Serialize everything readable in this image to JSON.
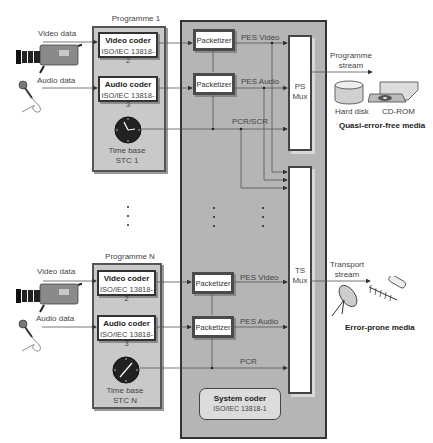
{
  "programmes": [
    {
      "title": "Programme 1",
      "video_input_label": "Video data",
      "audio_input_label": "Audio data",
      "video_coder": {
        "title": "Video coder",
        "standard": "ISO/IEC 13818-2"
      },
      "audio_coder": {
        "title": "Audio coder",
        "standard": "ISO/IEC 13818-3"
      },
      "time_base": {
        "line1": "Time base",
        "line2": "STC 1"
      }
    },
    {
      "title": "Programme N",
      "video_input_label": "Video data",
      "audio_input_label": "Audio data",
      "video_coder": {
        "title": "Video coder",
        "standard": "ISO/IEC 13818-2"
      },
      "audio_coder": {
        "title": "Audio coder",
        "standard": "ISO/IEC 13818-3"
      },
      "time_base": {
        "line1": "Time base",
        "line2": "STC N"
      }
    }
  ],
  "system": {
    "packetizer_label": "Packetizer",
    "ps_signals": {
      "video": "PES Video",
      "audio": "PES Audio",
      "clock": "PCR/SCR"
    },
    "ts_signals": {
      "video": "PES Video",
      "audio": "PES Audio",
      "clock": "PCR"
    },
    "ps_mux": "PS\nMux",
    "ts_mux": "TS\nMux",
    "coder": {
      "title": "System coder",
      "standard": "ISO/IEC 13818-1"
    }
  },
  "outputs": {
    "programme_stream": {
      "line1": "Programme",
      "line2": "stream"
    },
    "transport_stream": {
      "line1": "Transport",
      "line2": "stream"
    },
    "quasi_media": {
      "hard_disk": "Hard disk",
      "cd_rom": "CD-ROM",
      "caption": "Quasi-error-free media"
    },
    "error_media": {
      "caption": "Error-prone media"
    }
  },
  "icons": {
    "camera": "video-camera-icon",
    "microphone": "microphone-icon",
    "clock": "clock-icon",
    "hard_disk": "hard-disk-icon",
    "cd_rom": "cd-rom-drive-icon",
    "satellite_dish": "satellite-dish-icon",
    "antenna": "antenna-icon",
    "cable": "cable-icon"
  },
  "colors": {
    "panel_fill": "#c9c9c9",
    "system_fill": "#b5b5b5",
    "border": "#333333",
    "box_fill": "#ffffff"
  }
}
